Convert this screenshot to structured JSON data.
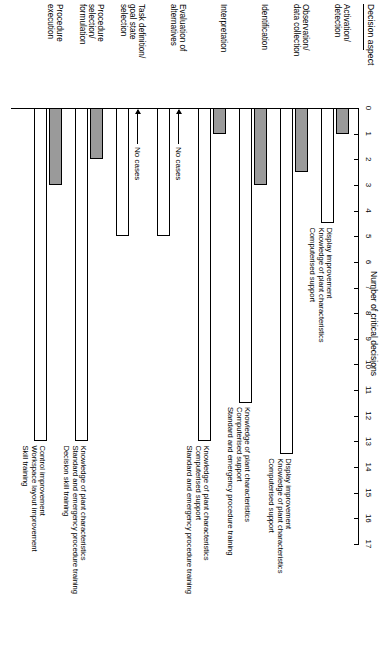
{
  "figure": {
    "y_axis_title": "Decision aspect",
    "x_axis_title": "Number of critical decisions",
    "no_cases_label": "No cases"
  },
  "axis": {
    "ticks": [
      "0",
      "1",
      "2",
      "3",
      "4",
      "5",
      "6",
      "7",
      "8",
      "9",
      "10",
      "11",
      "12",
      "13",
      "14",
      "15",
      "16",
      "17"
    ],
    "min": 0,
    "max": 17
  },
  "categories": [
    {
      "line1": "Activation/",
      "line2": "detection"
    },
    {
      "line1": "Observation/",
      "line2": "data collection"
    },
    {
      "line1": "Identification",
      "line2": ""
    },
    {
      "line1": "Interpretation",
      "line2": ""
    },
    {
      "line1": "Evaluation of",
      "line2": "alternatives"
    },
    {
      "line1": "Task definition/",
      "line2": "goal state",
      "line3": "selection"
    },
    {
      "line1": "Procedure",
      "line2": "selection/",
      "line3": "formulation"
    },
    {
      "line1": "Procedure",
      "line2": "execution"
    }
  ],
  "annotations": [
    {
      "lines": [
        "Display improvement",
        "Knowledge of plant characteristics",
        "Computerised support"
      ]
    },
    {
      "lines": [
        "Display improvement",
        "Knowledge of plant characteristics",
        "Computerised support"
      ]
    },
    {
      "lines": [
        "Knowledge of plant characteristics",
        "Computerised support",
        "Standard and emergency procedure training"
      ]
    },
    {
      "lines": [
        "Knowledge of plant characteristics",
        "Computerised support",
        "Standard and emergency procedure training"
      ]
    },
    {
      "lines": []
    },
    {
      "lines": []
    },
    {
      "lines": [
        "Knowledge of plant characteristics",
        "Standard and emergency procedure training",
        "Decision skill training"
      ]
    },
    {
      "lines": [
        "Control improvement",
        "Workspace layout improvement",
        "Skill training"
      ]
    }
  ],
  "chart_data": {
    "type": "bar",
    "title": "",
    "xlabel": "Number of critical decisions",
    "ylabel": "Decision aspect",
    "xlim": [
      0,
      17
    ],
    "grid": false,
    "orientation": "horizontal",
    "legend": [],
    "categories": [
      "Activation/detection",
      "Observation/data collection",
      "Identification",
      "Interpretation",
      "Evaluation of alternatives",
      "Task definition/goal state selection",
      "Procedure selection/formulation",
      "Procedure execution"
    ],
    "series": [
      {
        "name": "shaded",
        "values": [
          1,
          2.5,
          3,
          1,
          0,
          0,
          2,
          3
        ],
        "no_cases": [
          false,
          false,
          false,
          false,
          true,
          true,
          false,
          false
        ]
      },
      {
        "name": "open",
        "values": [
          4.5,
          13.5,
          11.5,
          13,
          5,
          5,
          13,
          13
        ],
        "no_cases": [
          false,
          false,
          false,
          false,
          false,
          false,
          false,
          false
        ]
      }
    ]
  }
}
